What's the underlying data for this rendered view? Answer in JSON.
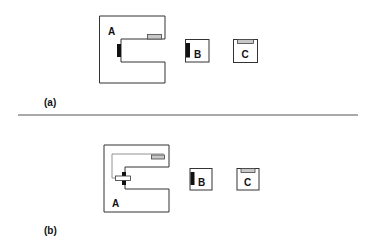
{
  "figure": {
    "panels": [
      {
        "caption": "(a)",
        "labels": {
          "a": "A",
          "b": "B",
          "c": "C"
        }
      },
      {
        "caption": "(b)",
        "labels": {
          "a": "A",
          "b": "B",
          "c": "C"
        }
      }
    ],
    "colors": {
      "outline": "#333333",
      "black_part": "#111111",
      "grey_part": "#c8c8c8",
      "divider": "#555555"
    }
  }
}
